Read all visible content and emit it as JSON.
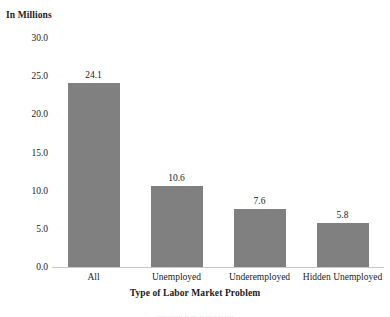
{
  "chart_data": {
    "type": "bar",
    "title": "",
    "ylabel": "In Millions",
    "xlabel": "Type of Labor Market Problem",
    "categories": [
      "All",
      "Unemployed",
      "Underemployed",
      "Hidden Unemployed"
    ],
    "values": [
      24.1,
      10.6,
      7.6,
      5.8
    ],
    "value_labels": [
      "24.1",
      "10.6",
      "7.6",
      "5.8"
    ],
    "ylim": [
      0.0,
      30.0
    ],
    "ytick_step": 5.0,
    "ytick_labels": [
      "30.0",
      "25.0",
      "20.0",
      "15.0",
      "10.0",
      "5.0",
      "0.0"
    ],
    "ytick_values": [
      30.0,
      25.0,
      20.0,
      15.0,
      10.0,
      5.0,
      0.0
    ],
    "grid": false,
    "legend": false,
    "bar_color": "#808080",
    "axis_color": "#c8c8c8",
    "text_color": "#1b1b1b"
  },
  "page": {
    "bleed_text": "............ ..  ... .. ...  . .. ...."
  }
}
